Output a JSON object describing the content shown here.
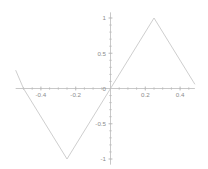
{
  "chart_data": {
    "type": "line",
    "title": "",
    "subtitle": "",
    "xlabel": "",
    "ylabel": "",
    "xlim": [
      -0.545,
      0.485
    ],
    "ylim": [
      -1.08,
      1.08
    ],
    "grid": false,
    "legend": null,
    "axis_style": "centered-spines",
    "x_ticks": [
      {
        "value": -0.4,
        "label": "-0.4"
      },
      {
        "value": -0.2,
        "label": "-0.2"
      },
      {
        "value": 0,
        "label": "0"
      },
      {
        "value": 0.2,
        "label": "0.2"
      },
      {
        "value": 0.4,
        "label": "0.4"
      }
    ],
    "y_ticks": [
      {
        "value": 1,
        "label": "1"
      },
      {
        "value": 0.5,
        "label": "0.5"
      },
      {
        "value": 0,
        "label": "0"
      },
      {
        "value": -0.5,
        "label": "-0.5"
      },
      {
        "value": -1,
        "label": "-1"
      }
    ],
    "x_minor_tick_step": 0.05,
    "y_minor_tick_step": 0.1,
    "series": [
      {
        "name": "triangle-wave",
        "color": "#c2c2c2",
        "x": [
          -0.545,
          -0.5,
          -0.25,
          0,
          0.25,
          0.485
        ],
        "y": [
          0.26,
          0.0,
          -1.0,
          0.0,
          1.0,
          0.06
        ],
        "points": [
          {
            "x": -0.545,
            "y": 0.26
          },
          {
            "x": -0.5,
            "y": 0.0
          },
          {
            "x": -0.25,
            "y": -1.0
          },
          {
            "x": 0.0,
            "y": 0.0
          },
          {
            "x": 0.25,
            "y": 1.0
          },
          {
            "x": 0.485,
            "y": 0.06
          }
        ]
      }
    ],
    "annotations": []
  },
  "plot": {
    "origin_px": {
      "x": 110.5,
      "y": 88.5
    },
    "scale_px": {
      "x": 174,
      "y": 70.5
    },
    "zero_label": "0"
  }
}
